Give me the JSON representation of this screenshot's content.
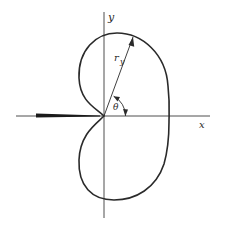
{
  "figure": {
    "type": "polar-cardioid-like pattern diagram",
    "labels": {
      "x_axis": "x",
      "y_axis": "y",
      "radius": "r",
      "radius_subscript": "y",
      "angle": "θ"
    },
    "colors": {
      "stroke": "#2a2a2a",
      "background": "#ffffff"
    },
    "elements": {
      "x_axis": "horizontal axis with thick wedge on negative side",
      "y_axis": "vertical axis",
      "curve": "closed kidney/cardioid-shaped curve with cusp at origin",
      "radius_vector": "arrow from origin to curve",
      "angle_arc": "arc arrow from x-axis to radius vector"
    }
  }
}
